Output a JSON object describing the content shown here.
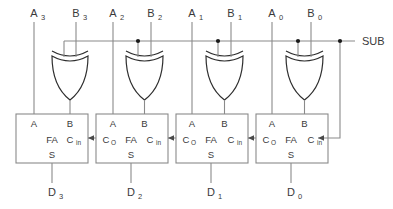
{
  "diagram": {
    "control": {
      "label": "SUB",
      "name": "sub-control-line"
    },
    "colors": {
      "background": "#ffffff",
      "wire": "#8a8a8a",
      "gate_stroke": "#2e2e2e",
      "box_stroke": "#8a8a8a",
      "text": "#3a3a3a",
      "junction_dot": "#1a1a1a"
    },
    "stages": [
      {
        "index": 3,
        "a_label": "A",
        "a_sub": "3",
        "b_label": "B",
        "b_sub": "3",
        "d_label": "D",
        "d_sub": "3",
        "gate_type": "xor",
        "fa_label": "FA",
        "pin_a": "A",
        "pin_b": "B",
        "pin_s": "S",
        "pin_cin": "C",
        "pin_cin_sub": "in",
        "pin_cout": "",
        "pin_cout_sub": ""
      },
      {
        "index": 2,
        "a_label": "A",
        "a_sub": "2",
        "b_label": "B",
        "b_sub": "2",
        "d_label": "D",
        "d_sub": "2",
        "gate_type": "xor",
        "fa_label": "FA",
        "pin_a": "A",
        "pin_b": "B",
        "pin_s": "S",
        "pin_cin": "C",
        "pin_cin_sub": "in",
        "pin_cout": "C",
        "pin_cout_sub": "O"
      },
      {
        "index": 1,
        "a_label": "A",
        "a_sub": "1",
        "b_label": "B",
        "b_sub": "1",
        "d_label": "D",
        "d_sub": "1",
        "gate_type": "xor",
        "fa_label": "FA",
        "pin_a": "A",
        "pin_b": "B",
        "pin_s": "S",
        "pin_cin": "C",
        "pin_cin_sub": "in",
        "pin_cout": "C",
        "pin_cout_sub": "O"
      },
      {
        "index": 0,
        "a_label": "A",
        "a_sub": "0",
        "b_label": "B",
        "b_sub": "0",
        "d_label": "D",
        "d_sub": "0",
        "gate_type": "xor",
        "fa_label": "FA",
        "pin_a": "A",
        "pin_b": "B",
        "pin_s": "S",
        "pin_cin": "C",
        "pin_cin_sub": "in",
        "pin_cout": "C",
        "pin_cout_sub": "O"
      }
    ]
  }
}
